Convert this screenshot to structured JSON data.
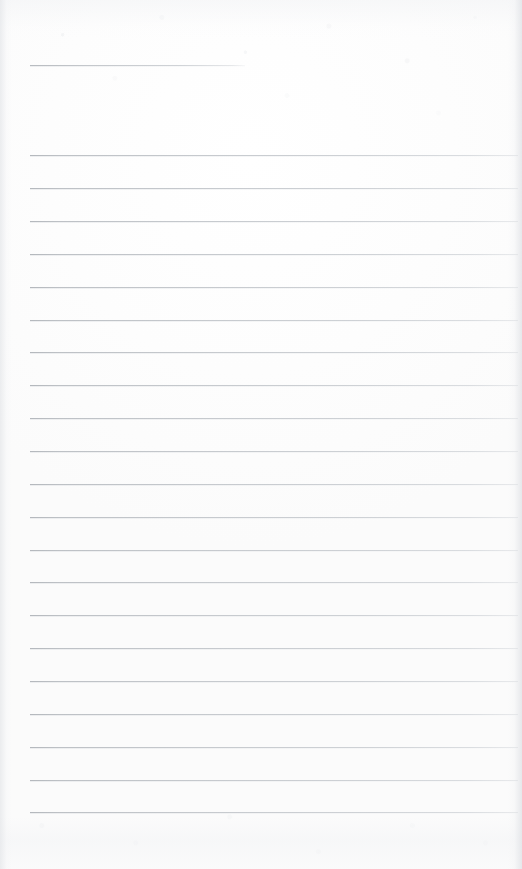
{
  "document": {
    "kind": "scanned-lined-paper",
    "title": "",
    "visible_text": "",
    "page_width": 522,
    "page_height": 869,
    "background_color": "#fdfdfd",
    "rule_color": "#b8bcc1",
    "note": ""
  },
  "rules": {
    "left_margin_x": 30,
    "right_edge_x": 518,
    "line_spacing": 32.7,
    "short_rule": {
      "y": 65,
      "x_start": 30,
      "x_end": 245,
      "width": 215
    },
    "full_rules_count": 21,
    "first_full_rule_y": 155,
    "last_full_rule_y": 812,
    "lines": [
      {
        "index": 0,
        "y": 65,
        "x": 30,
        "width": 215,
        "type": "short"
      },
      {
        "index": 1,
        "y": 155,
        "x": 30,
        "width": 488,
        "type": "full"
      },
      {
        "index": 2,
        "y": 188,
        "x": 30,
        "width": 488,
        "type": "full"
      },
      {
        "index": 3,
        "y": 221,
        "x": 30,
        "width": 488,
        "type": "full"
      },
      {
        "index": 4,
        "y": 254,
        "x": 30,
        "width": 488,
        "type": "full"
      },
      {
        "index": 5,
        "y": 287,
        "x": 30,
        "width": 488,
        "type": "full"
      },
      {
        "index": 6,
        "y": 320,
        "x": 30,
        "width": 488,
        "type": "full"
      },
      {
        "index": 7,
        "y": 352,
        "x": 30,
        "width": 488,
        "type": "full"
      },
      {
        "index": 8,
        "y": 385,
        "x": 30,
        "width": 488,
        "type": "full"
      },
      {
        "index": 9,
        "y": 418,
        "x": 30,
        "width": 488,
        "type": "full"
      },
      {
        "index": 10,
        "y": 451,
        "x": 30,
        "width": 488,
        "type": "full"
      },
      {
        "index": 11,
        "y": 484,
        "x": 30,
        "width": 488,
        "type": "full"
      },
      {
        "index": 12,
        "y": 517,
        "x": 30,
        "width": 488,
        "type": "full"
      },
      {
        "index": 13,
        "y": 550,
        "x": 30,
        "width": 488,
        "type": "full"
      },
      {
        "index": 14,
        "y": 582,
        "x": 30,
        "width": 488,
        "type": "full"
      },
      {
        "index": 15,
        "y": 615,
        "x": 30,
        "width": 488,
        "type": "full"
      },
      {
        "index": 16,
        "y": 648,
        "x": 30,
        "width": 488,
        "type": "full"
      },
      {
        "index": 17,
        "y": 681,
        "x": 30,
        "width": 488,
        "type": "full"
      },
      {
        "index": 18,
        "y": 714,
        "x": 30,
        "width": 488,
        "type": "full"
      },
      {
        "index": 19,
        "y": 747,
        "x": 30,
        "width": 488,
        "type": "full"
      },
      {
        "index": 20,
        "y": 780,
        "x": 30,
        "width": 488,
        "type": "full"
      },
      {
        "index": 21,
        "y": 812,
        "x": 30,
        "width": 488,
        "type": "full"
      }
    ]
  }
}
